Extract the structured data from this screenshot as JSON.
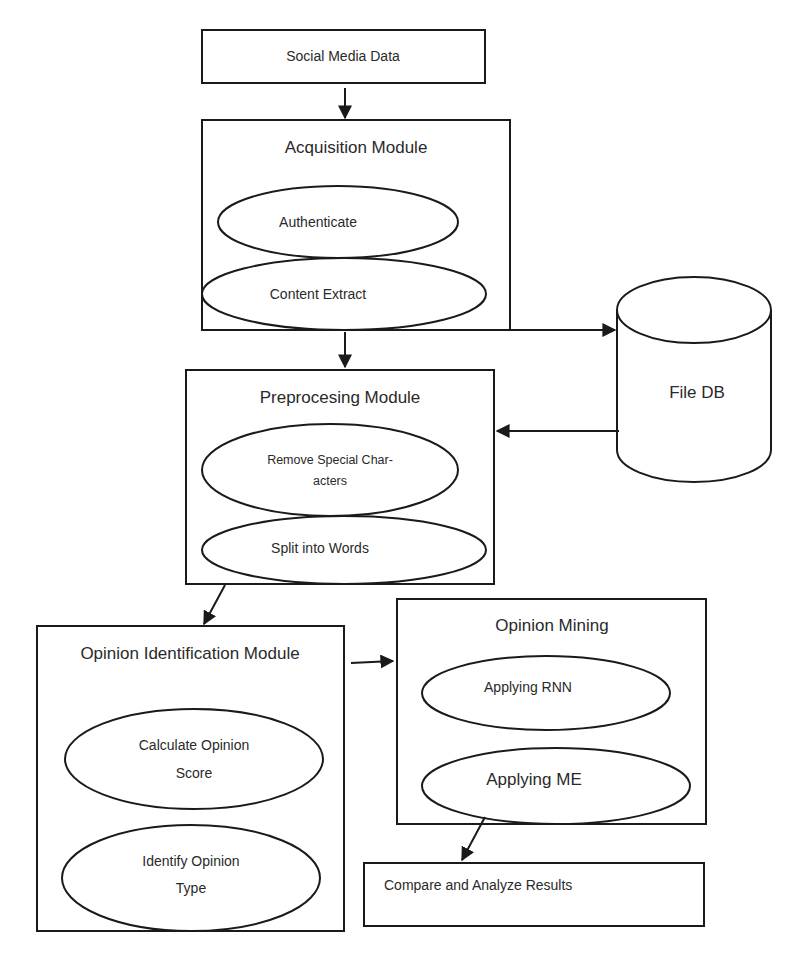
{
  "diagram": {
    "source": {
      "label": "Social Media Data"
    },
    "acquisition": {
      "title": "Acquisition Module",
      "steps": [
        "Authenticate",
        "Content Extract"
      ]
    },
    "storage": {
      "label": "File DB"
    },
    "preprocessing": {
      "title": "Preprocesing Module",
      "steps": [
        {
          "line1": "Remove Special Char-",
          "line2": "acters"
        },
        {
          "line1": "Split into Words"
        }
      ]
    },
    "opinion_identification": {
      "title": "Opinion Identification Module",
      "steps": [
        {
          "line1": "Calculate Opinion",
          "line2": "Score"
        },
        {
          "line1": "Identify Opinion",
          "line2": "Type"
        }
      ]
    },
    "opinion_mining": {
      "title": "Opinion Mining",
      "steps": [
        "Applying RNN",
        "Applying ME"
      ]
    },
    "results": {
      "label": "Compare and Analyze Results"
    },
    "edges": [
      {
        "from": "Social Media Data",
        "to": "Acquisition Module"
      },
      {
        "from": "Acquisition Module",
        "to": "Preprocesing Module"
      },
      {
        "from": "Acquisition Module",
        "to": "File DB"
      },
      {
        "from": "File DB",
        "to": "Preprocesing Module"
      },
      {
        "from": "Preprocesing Module",
        "to": "Opinion Identification Module"
      },
      {
        "from": "Opinion Identification Module",
        "to": "Opinion Mining"
      },
      {
        "from": "Applying ME",
        "to": "Compare and Analyze Results"
      }
    ],
    "colors": {
      "stroke": "#1a1a1a",
      "text": "#2a2a2a",
      "background": "#ffffff"
    }
  }
}
